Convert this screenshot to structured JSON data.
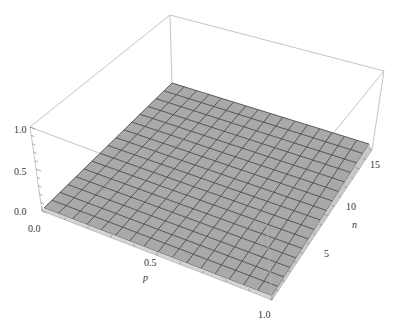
{
  "chart_data": {
    "type": "surface3d",
    "title": "",
    "axes": {
      "x": {
        "label": "p",
        "range": [
          0.0,
          1.0
        ],
        "ticks": [
          "0.0",
          "0.5",
          "1.0"
        ]
      },
      "y": {
        "label": "n",
        "range": [
          1,
          17
        ],
        "ticks": [
          "5",
          "10",
          "15"
        ]
      },
      "z": {
        "label": "",
        "range": [
          0.0,
          1.0
        ],
        "ticks": [
          "0.0",
          "0.5",
          "1.0"
        ]
      }
    },
    "surface": {
      "description": "Flat surface at z ≈ 0 across the full p–n domain",
      "z_value": 0.0,
      "mesh_cells_p": 16,
      "mesh_cells_n": 16,
      "fill_color": "#a9a9a9",
      "mesh_color": "#4d4d4d"
    },
    "box": {
      "visible": true,
      "edge_color": "#b5b5b5"
    },
    "projection": {
      "bottom": {
        "p0_n0": [
          42,
          211
        ],
        "p1_n0": [
          272,
          300
        ],
        "p1_nmax": [
          372,
          150
        ],
        "p0_nmax": [
          172,
          84
        ]
      },
      "top": {
        "p0_n0": [
          30,
          127
        ],
        "p1_n0": [
          266,
          216
        ],
        "p1_nmax": [
          384,
          71
        ],
        "p0_nmax": [
          170,
          15
        ]
      },
      "surface": {
        "p0_n0": [
          44,
          208
        ],
        "p1_n0": [
          272,
          296
        ],
        "p1_nmax": [
          369,
          144
        ],
        "p0_nmax": [
          172,
          83
        ]
      }
    },
    "label_positions": {
      "z_ticks": [
        [
          14,
          215
        ],
        [
          14,
          175
        ],
        [
          14,
          133
        ]
      ],
      "p_ticks": [
        [
          28,
          232
        ],
        [
          144,
          266
        ],
        [
          258,
          318
        ]
      ],
      "p_label": [
        143,
        281
      ],
      "n_ticks": [
        [
          324,
          257
        ],
        [
          346,
          210
        ],
        [
          370,
          168
        ]
      ],
      "n_label": [
        352,
        228
      ]
    }
  }
}
